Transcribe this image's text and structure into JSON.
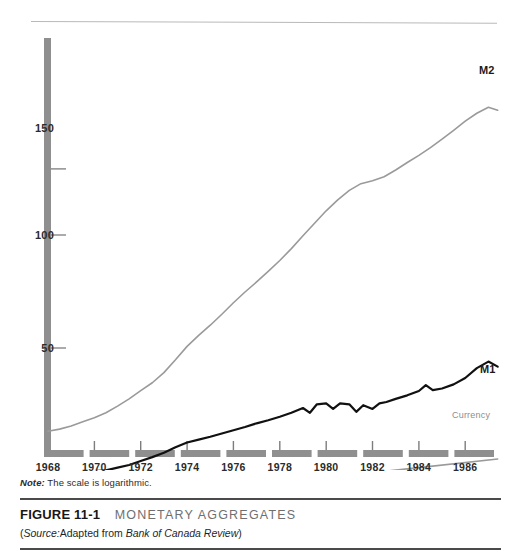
{
  "figure": {
    "number_label": "FIGURE 11-1",
    "title": "MONETARY AGGREGATES",
    "note": "The scale is logarithmic.",
    "note_prefix": "Note:",
    "source_open": "(",
    "source_label": "Source:",
    "source_text": "Adapted from ",
    "source_publication": "Bank of Canada Review",
    "source_close": ")"
  },
  "colors": {
    "axis_gray": "#8f8f8f",
    "m2_line": "#9a9a9a",
    "m1_line": "#111111",
    "currency_line": "#9a9a9a",
    "rule_dark": "#4a4a4a",
    "rule_light": "#b9b9bb",
    "text": "#1a1a1a",
    "title_gray": "#6f6f6f"
  },
  "chart_data": {
    "type": "line",
    "title": "MONETARY AGGREGATES",
    "xlabel": "",
    "ylabel": "",
    "scale": "logarithmic",
    "grid": false,
    "legend_position": "inline-right-end-labels",
    "xlim": [
      1968,
      1987.5
    ],
    "ylim": [
      20,
      230
    ],
    "yticks": [
      50,
      100,
      150
    ],
    "ytick_labels": [
      "50",
      "100",
      "150"
    ],
    "xticks": [
      1968,
      1970,
      1972,
      1974,
      1976,
      1978,
      1980,
      1982,
      1984,
      1986
    ],
    "xtick_labels": [
      "1968",
      "1970",
      "1972",
      "1974",
      "1976",
      "1978",
      "1980",
      "1982",
      "1984",
      "1986"
    ],
    "annotations": [
      "Note: The scale is logarithmic."
    ],
    "series": [
      {
        "name": "M2",
        "label": "M2",
        "color": "#9a9a9a",
        "width": 1.6,
        "x": [
          1968.0,
          1968.5,
          1969.0,
          1969.5,
          1970.0,
          1970.5,
          1971.0,
          1971.5,
          1972.0,
          1972.5,
          1973.0,
          1973.5,
          1974.0,
          1974.5,
          1975.0,
          1975.5,
          1976.0,
          1976.5,
          1977.0,
          1977.5,
          1978.0,
          1978.5,
          1979.0,
          1979.5,
          1980.0,
          1980.5,
          1981.0,
          1981.5,
          1982.0,
          1982.5,
          1983.0,
          1983.5,
          1984.0,
          1984.5,
          1985.0,
          1985.5,
          1986.0,
          1986.5,
          1987.0,
          1987.4
        ],
        "y": [
          30.0,
          30.4,
          31.0,
          31.8,
          32.6,
          33.6,
          35.0,
          36.6,
          38.5,
          40.4,
          43.0,
          46.5,
          50.5,
          54.0,
          57.5,
          61.5,
          66.0,
          70.5,
          75.0,
          80.0,
          85.5,
          92.0,
          99.5,
          107.5,
          116.0,
          124.0,
          131.5,
          137.0,
          139.5,
          143.0,
          149.0,
          156.0,
          163.0,
          171.0,
          180.0,
          190.0,
          201.0,
          211.0,
          219.0,
          215.0
        ]
      },
      {
        "name": "M1",
        "label": "M1",
        "color": "#111111",
        "width": 2.2,
        "x": [
          1968.0,
          1968.5,
          1969.0,
          1969.5,
          1970.0,
          1970.5,
          1971.0,
          1971.5,
          1972.0,
          1972.5,
          1973.0,
          1973.5,
          1974.0,
          1974.5,
          1975.0,
          1975.5,
          1976.0,
          1976.5,
          1977.0,
          1977.5,
          1978.0,
          1978.5,
          1979.0,
          1979.3,
          1979.6,
          1980.0,
          1980.3,
          1980.6,
          1981.0,
          1981.3,
          1981.6,
          1982.0,
          1982.3,
          1982.6,
          1983.0,
          1983.5,
          1984.0,
          1984.3,
          1984.6,
          1985.0,
          1985.5,
          1986.0,
          1986.5,
          1987.0,
          1987.4
        ],
        "y": [
          22.0,
          22.1,
          22.6,
          23.2,
          23.5,
          23.6,
          24.0,
          24.4,
          25.0,
          25.6,
          26.3,
          27.2,
          28.0,
          28.5,
          29.0,
          29.6,
          30.2,
          30.8,
          31.5,
          32.1,
          32.8,
          33.6,
          34.6,
          33.6,
          35.4,
          35.6,
          34.4,
          35.6,
          35.4,
          33.8,
          35.2,
          34.4,
          35.6,
          35.9,
          36.6,
          37.4,
          38.4,
          39.8,
          38.6,
          39.0,
          40.0,
          41.6,
          44.2,
          46.0,
          44.6
        ]
      },
      {
        "name": "Currency",
        "label": "Currency",
        "color": "#9a9a9a",
        "width": 1.6,
        "x": [
          1968.0,
          1972.0,
          1976.0,
          1980.0,
          1984.0,
          1987.4
        ],
        "y": [
          19.6,
          20.4,
          21.4,
          22.6,
          24.0,
          25.3
        ]
      }
    ]
  }
}
